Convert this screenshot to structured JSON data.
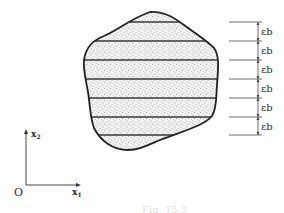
{
  "figure": {
    "caption": "Fig. 15.3",
    "colors": {
      "ink": "#2a2a2a",
      "fill": "#d9d9d9",
      "background": "#ffffff"
    }
  },
  "axes": {
    "origin_label": "O",
    "x_label": "x",
    "x_sub": "1",
    "y_label": "x",
    "y_sub": "2"
  },
  "region": {
    "description": "stippled irregular cross-section divided into horizontal strips",
    "strip_lines_y": [
      22,
      41,
      60,
      79,
      98,
      117,
      135
    ]
  },
  "dimensions": {
    "labels": [
      "εb",
      "εb",
      "εb",
      "εb",
      "εb",
      "εb"
    ]
  }
}
